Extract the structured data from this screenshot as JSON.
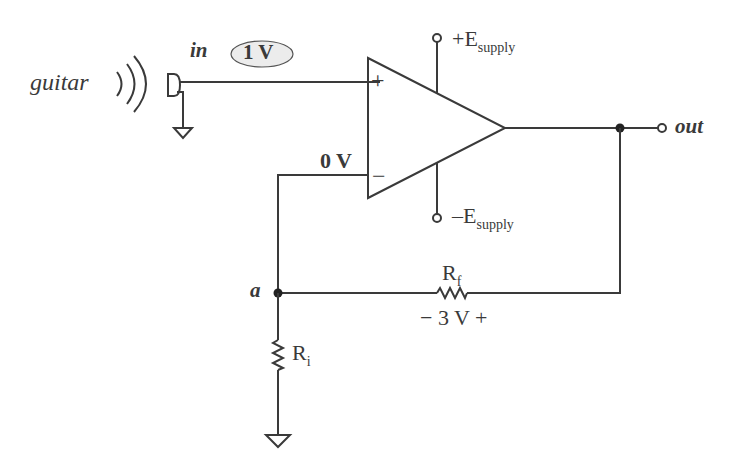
{
  "diagram": {
    "type": "non-inverting op-amp amplifier",
    "source": {
      "label": "guitar"
    },
    "input": {
      "label": "in",
      "voltage_badge": "1 V"
    },
    "opamp": {
      "plus_label": "+",
      "minus_label": "−",
      "differential_label": "0 V",
      "supply_pos": {
        "main": "+E",
        "sub": "supply"
      },
      "supply_neg": {
        "main": "–E",
        "sub": "supply"
      }
    },
    "output": {
      "label": "out"
    },
    "node_a": {
      "label": "a"
    },
    "rf": {
      "main": "R",
      "sub": "f",
      "voltage": "− 3 V +"
    },
    "ri": {
      "main": "R",
      "sub": "i"
    }
  },
  "colors": {
    "line": "#3a3a3a",
    "badge_fill": "#ececec"
  }
}
